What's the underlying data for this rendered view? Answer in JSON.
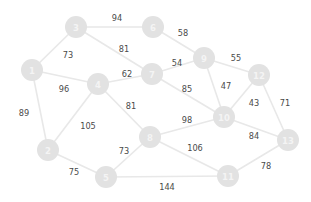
{
  "graph": {
    "title": "weighted-undirected-graph",
    "colors": {
      "background": "#ffffff",
      "node_fill": "#e2e2e2",
      "node_label": "#f4f4f4",
      "edge_stroke": "#e8e8e8",
      "edge_label": "#4a4a4a"
    },
    "node_radius": 11,
    "nodes": [
      {
        "id": "1",
        "label": "1",
        "x": 32,
        "y": 70
      },
      {
        "id": "2",
        "label": "2",
        "x": 48,
        "y": 150
      },
      {
        "id": "3",
        "label": "3",
        "x": 76,
        "y": 27
      },
      {
        "id": "4",
        "label": "4",
        "x": 98,
        "y": 84
      },
      {
        "id": "5",
        "label": "5",
        "x": 106,
        "y": 177
      },
      {
        "id": "6",
        "label": "6",
        "x": 153,
        "y": 27
      },
      {
        "id": "7",
        "label": "7",
        "x": 152,
        "y": 74
      },
      {
        "id": "8",
        "label": "8",
        "x": 150,
        "y": 137
      },
      {
        "id": "9",
        "label": "9",
        "x": 204,
        "y": 58
      },
      {
        "id": "10",
        "label": "10",
        "x": 224,
        "y": 117
      },
      {
        "id": "11",
        "label": "11",
        "x": 228,
        "y": 176
      },
      {
        "id": "12",
        "label": "12",
        "x": 259,
        "y": 75
      },
      {
        "id": "13",
        "label": "13",
        "x": 288,
        "y": 140
      }
    ],
    "edges": [
      {
        "source": "1",
        "target": "3",
        "weight": "73",
        "lx": 68,
        "ly": 55
      },
      {
        "source": "1",
        "target": "4",
        "weight": "96",
        "lx": 64,
        "ly": 89
      },
      {
        "source": "1",
        "target": "2",
        "weight": "89",
        "lx": 24,
        "ly": 113
      },
      {
        "source": "2",
        "target": "4",
        "weight": "105",
        "lx": 88,
        "ly": 126
      },
      {
        "source": "2",
        "target": "5",
        "weight": "75",
        "lx": 74,
        "ly": 172
      },
      {
        "source": "3",
        "target": "6",
        "weight": "94",
        "lx": 117,
        "ly": 18
      },
      {
        "source": "3",
        "target": "7",
        "weight": "81",
        "lx": 124,
        "ly": 49
      },
      {
        "source": "4",
        "target": "7",
        "weight": "62",
        "lx": 127,
        "ly": 74
      },
      {
        "source": "4",
        "target": "8",
        "weight": "81",
        "lx": 131,
        "ly": 106
      },
      {
        "source": "5",
        "target": "8",
        "weight": "73",
        "lx": 124,
        "ly": 151
      },
      {
        "source": "5",
        "target": "11",
        "weight": "144",
        "lx": 167,
        "ly": 187
      },
      {
        "source": "6",
        "target": "9",
        "weight": "58",
        "lx": 183,
        "ly": 33
      },
      {
        "source": "7",
        "target": "9",
        "weight": "54",
        "lx": 177,
        "ly": 63
      },
      {
        "source": "7",
        "target": "10",
        "weight": "85",
        "lx": 187,
        "ly": 89
      },
      {
        "source": "8",
        "target": "10",
        "weight": "98",
        "lx": 187,
        "ly": 120
      },
      {
        "source": "8",
        "target": "11",
        "weight": "106",
        "lx": 195,
        "ly": 148
      },
      {
        "source": "9",
        "target": "12",
        "weight": "55",
        "lx": 236,
        "ly": 58
      },
      {
        "source": "9",
        "target": "10",
        "weight": "47",
        "lx": 226,
        "ly": 86
      },
      {
        "source": "10",
        "target": "12",
        "weight": "43",
        "lx": 254,
        "ly": 103
      },
      {
        "source": "10",
        "target": "13",
        "weight": "84",
        "lx": 254,
        "ly": 136
      },
      {
        "source": "11",
        "target": "13",
        "weight": "78",
        "lx": 266,
        "ly": 166
      },
      {
        "source": "12",
        "target": "13",
        "weight": "71",
        "lx": 285,
        "ly": 103
      }
    ]
  }
}
